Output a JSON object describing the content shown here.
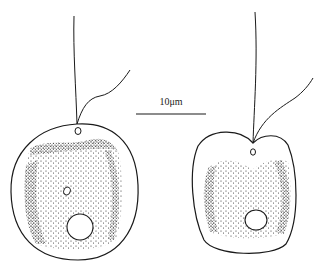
{
  "figure": {
    "scale_bar": {
      "label": "10μm"
    },
    "cells": [
      {
        "name": "cell-left",
        "shape": "rounded-ellipse"
      },
      {
        "name": "cell-right",
        "shape": "heart-shaped"
      }
    ],
    "colors": {
      "ink": "#1a1a1a",
      "background": "#ffffff"
    }
  }
}
